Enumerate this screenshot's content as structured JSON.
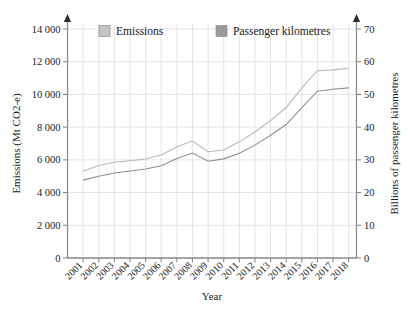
{
  "chart_data": {
    "type": "line",
    "title": "",
    "xlabel": "Year",
    "ylabel": "Emissions (Mt CO2-e)",
    "y2label": "Billions of passenger kilometres",
    "grid": true,
    "legend_position": "top-inside",
    "categories": [
      "2001",
      "2002",
      "2003",
      "2004",
      "2005",
      "2006",
      "2007",
      "2008",
      "2009",
      "2010",
      "2011",
      "2012",
      "2013",
      "2014",
      "2015",
      "2016",
      "2017",
      "2018"
    ],
    "x": [
      2001,
      2002,
      2003,
      2004,
      2005,
      2006,
      2007,
      2008,
      2009,
      2010,
      2011,
      2012,
      2013,
      2014,
      2015,
      2016,
      2017,
      2018
    ],
    "ylim": [
      0,
      14000
    ],
    "yticks": [
      0,
      2000,
      4000,
      6000,
      8000,
      10000,
      12000,
      14000
    ],
    "ytick_labels": [
      "0",
      "2 000",
      "4 000",
      "6 000",
      "8 000",
      "10 000",
      "12 000",
      "14 000"
    ],
    "y2lim": [
      0,
      70
    ],
    "y2ticks": [
      0,
      10,
      20,
      30,
      40,
      50,
      60,
      70
    ],
    "y2tick_labels": [
      "0",
      "10",
      "20",
      "30",
      "40",
      "50",
      "60",
      "70"
    ],
    "series": [
      {
        "name": "Emissions",
        "axis": "left",
        "color": "#b8b8b8",
        "unit": "Mt CO2-e",
        "values": [
          5300,
          5620,
          5820,
          5930,
          6020,
          6250,
          6700,
          7150,
          6550,
          6600,
          7050,
          7600,
          8250,
          8650,
          8800,
          8800,
          9050,
          9300
        ]
      },
      {
        "name": "Passenger kilometres",
        "axis": "right",
        "color": "#8f8f8f",
        "unit": "Billions of passenger kilometres",
        "values": [
          24.0,
          25.4,
          26.2,
          26.8,
          27.3,
          28.4,
          30.6,
          32.5,
          29.8,
          30.2,
          32.4,
          35.0,
          38.0,
          40.0,
          40.4,
          40.5,
          41.8,
          43.0
        ]
      }
    ],
    "series_left_pixel_values": [
      5300,
      5620,
      5820,
      5930,
      6020,
      6250,
      6700,
      7150,
      6550,
      6600,
      7050,
      7600,
      8250,
      8650,
      8800,
      8800,
      9050,
      9300
    ],
    "emissions_curve": [
      5300,
      5650,
      5850,
      5950,
      6050,
      6300,
      6800,
      7150,
      6500,
      6600,
      7100,
      7700,
      8400,
      9200,
      10400,
      11450,
      11500,
      11600
    ],
    "pkm_curve": [
      23.8,
      25.0,
      26.0,
      26.6,
      27.2,
      28.2,
      30.4,
      32.1,
      29.6,
      30.3,
      32.0,
      34.5,
      37.5,
      40.8,
      46.0,
      51.0,
      51.6,
      52.0
    ]
  },
  "legend": {
    "items": [
      {
        "label": "Emissions",
        "color": "#c4c4c4"
      },
      {
        "label": "Passenger kilometres",
        "color": "#9a9a9a"
      }
    ]
  },
  "axes": {
    "left_title": "Emissions (Mt CO2-e)",
    "right_title": "Billions of passenger kilometres",
    "bottom_title": "Year",
    "left_ticks": [
      "0",
      "2 000",
      "4 000",
      "6 000",
      "8 000",
      "10 000",
      "12 000",
      "14 000"
    ],
    "right_ticks": [
      "0",
      "10",
      "20",
      "30",
      "40",
      "50",
      "60",
      "70"
    ],
    "x_ticks": [
      "2001",
      "2002",
      "2003",
      "2004",
      "2005",
      "2006",
      "2007",
      "2008",
      "2009",
      "2010",
      "2011",
      "2012",
      "2013",
      "2014",
      "2015",
      "2016",
      "2017",
      "2018"
    ]
  },
  "colors": {
    "grid": "#d9d9d9",
    "axis": "#8a8a8a",
    "series_upper": "#9e9e9e",
    "series_lower": "#9e9e9e",
    "background": "#ffffff"
  }
}
